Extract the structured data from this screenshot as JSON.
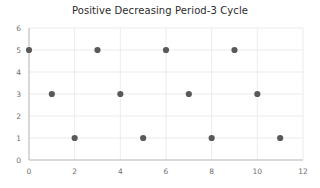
{
  "chart": {
    "title": "Positive Decreasing Period-3 Cycle"
  },
  "chart_data": {
    "type": "scatter",
    "title": "Positive Decreasing Period-3 Cycle",
    "xlabel": "",
    "ylabel": "",
    "x": [
      0,
      1,
      2,
      3,
      4,
      5,
      6,
      7,
      8,
      9,
      10,
      11
    ],
    "y": [
      5,
      3,
      1,
      5,
      3,
      1,
      5,
      3,
      1,
      5,
      3,
      1
    ],
    "points": [
      {
        "x": 0,
        "y": 5
      },
      {
        "x": 1,
        "y": 3
      },
      {
        "x": 2,
        "y": 1
      },
      {
        "x": 3,
        "y": 5
      },
      {
        "x": 4,
        "y": 3
      },
      {
        "x": 5,
        "y": 1
      },
      {
        "x": 6,
        "y": 5
      },
      {
        "x": 7,
        "y": 3
      },
      {
        "x": 8,
        "y": 1
      },
      {
        "x": 9,
        "y": 5
      },
      {
        "x": 10,
        "y": 3
      },
      {
        "x": 11,
        "y": 1
      }
    ],
    "xlim": [
      0,
      12
    ],
    "ylim": [
      0,
      6
    ],
    "xticks": [
      0,
      2,
      4,
      6,
      8,
      10,
      12
    ],
    "yticks": [
      0,
      1,
      2,
      3,
      4,
      5,
      6
    ],
    "xtick_labels": [
      "0",
      "2",
      "4",
      "6",
      "8",
      "10",
      "12"
    ],
    "ytick_labels": [
      "0",
      "1",
      "2",
      "3",
      "4",
      "5",
      "6"
    ],
    "grid": true,
    "grid_color": "#e6e6e6",
    "marker_color": "#595959",
    "marker_size": 4.2,
    "legend": null,
    "legend_position": "none",
    "annotations": []
  }
}
